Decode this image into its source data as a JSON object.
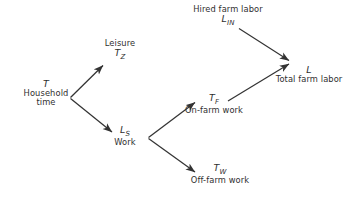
{
  "diagram": {
    "background_color": "#ffffff",
    "line_color": "#333333",
    "text_color": "#2f2f2f",
    "nodes": [
      {
        "id": "household",
        "symbol": "T",
        "caption_line1": "Household",
        "caption_line2": "time"
      },
      {
        "id": "leisure",
        "symbol_base": "T",
        "symbol_sub": "Z",
        "caption_line1": "Leisure"
      },
      {
        "id": "work",
        "symbol_base": "L",
        "symbol_sub": "S",
        "caption_line1": "Work"
      },
      {
        "id": "onfarm",
        "symbol_base": "T",
        "symbol_sub": "F",
        "caption_line1": "On-farm work"
      },
      {
        "id": "offfarm",
        "symbol_base": "T",
        "symbol_sub": "W",
        "caption_line1": "Off-farm work"
      },
      {
        "id": "hired",
        "symbol_base": "L",
        "symbol_sub": "IN",
        "caption_line1": "Hired farm labor"
      },
      {
        "id": "total",
        "symbol": "L",
        "caption_line1": "Total farm labor"
      }
    ],
    "arrows": [
      {
        "id": "household-to-leisure",
        "from": "household",
        "to": "leisure"
      },
      {
        "id": "household-to-work",
        "from": "household",
        "to": "work"
      },
      {
        "id": "work-to-onfarm",
        "from": "work",
        "to": "onfarm"
      },
      {
        "id": "work-to-offfarm",
        "from": "work",
        "to": "offfarm"
      },
      {
        "id": "hired-to-total",
        "from": "hired",
        "to": "total"
      },
      {
        "id": "onfarm-to-total",
        "from": "onfarm",
        "to": "total"
      }
    ]
  }
}
